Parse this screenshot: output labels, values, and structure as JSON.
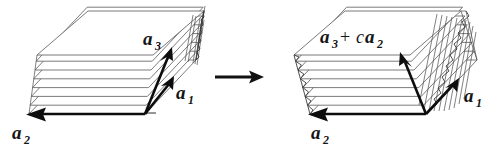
{
  "figure": {
    "background_color": "#ffffff",
    "ink_color": "#0d0d0d",
    "sheet_edge_color": "#5a5a5a",
    "transform_arrow": {
      "name": "maps-to",
      "glyph": "→",
      "direction": "right"
    },
    "panels": [
      {
        "id": "left",
        "caption": "",
        "n_sheets": 10,
        "labels": [
          {
            "id": "a3",
            "base": "a",
            "sub": "3",
            "text": "a₃"
          },
          {
            "id": "a1",
            "base": "a",
            "sub": "1",
            "text": "a₁"
          },
          {
            "id": "a2",
            "base": "a",
            "sub": "2",
            "text": "a₂"
          }
        ],
        "vectors": [
          {
            "id": "a1",
            "label": "a₁",
            "direction": "up-right"
          },
          {
            "id": "a2",
            "label": "a₂",
            "direction": "left"
          },
          {
            "id": "a3",
            "label": "a₃",
            "direction": "up-right-steep"
          }
        ]
      },
      {
        "id": "right",
        "caption": "",
        "n_sheets": 10,
        "labels": [
          {
            "id": "a3plusca2",
            "text": "a₃ + ca₂",
            "parts": [
              "a",
              "3",
              "+",
              "c",
              "a",
              "2"
            ]
          },
          {
            "id": "a1",
            "base": "a",
            "sub": "1",
            "text": "a₁"
          },
          {
            "id": "a2",
            "base": "a",
            "sub": "2",
            "text": "a₂"
          }
        ],
        "vectors": [
          {
            "id": "a1",
            "label": "a₁",
            "direction": "up-right"
          },
          {
            "id": "a2",
            "label": "a₂",
            "direction": "left"
          },
          {
            "id": "a3plusca2",
            "label": "a₃ + ca₂",
            "direction": "up-left-steep"
          }
        ]
      }
    ],
    "text": {
      "a_base": "a",
      "c_base": "c",
      "sub_1": "1",
      "sub_2": "2",
      "sub_3": "3",
      "plus": "+"
    }
  }
}
